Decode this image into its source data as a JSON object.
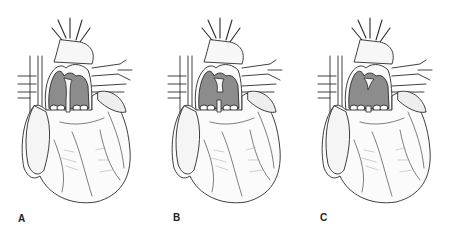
{
  "figure": {
    "background": "#ffffff",
    "line_color": "#2a2a2a",
    "chamber_fill": "#8c8c8c",
    "panels": [
      {
        "label": "A",
        "variant": "separate",
        "offset_x": 0,
        "label_x": 18,
        "label_y": 213
      },
      {
        "label": "B",
        "variant": "partial",
        "offset_x": 150,
        "label_x": 23,
        "label_y": 212
      },
      {
        "label": "C",
        "variant": "common",
        "offset_x": 300,
        "label_x": 20,
        "label_y": 212
      }
    ]
  }
}
